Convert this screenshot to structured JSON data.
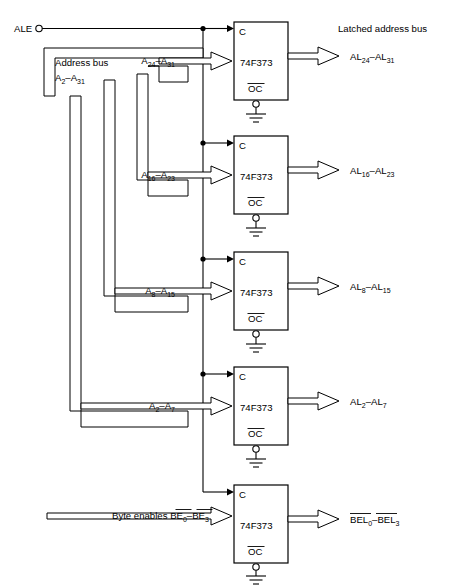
{
  "diagram": {
    "signals": {
      "ale_label": "ALE",
      "address_bus_line1": "Address bus",
      "address_bus_line2_base": "A",
      "address_bus_line2_sub_lo": "2",
      "address_bus_line2_dash": "–A",
      "address_bus_line2_sub_hi": "31",
      "latched_bus_header": "Latched address bus",
      "byte_enables_text": "Byte enables",
      "chip_type": "74F373",
      "clock_pin": "C",
      "oc_pin": "OC"
    },
    "latches": [
      {
        "id": "latch-1",
        "chip": "74F373",
        "clock_pin": "C",
        "oc_pin": "OC",
        "input_base": "A",
        "input_sub_lo": "24",
        "input_dash": "–A",
        "input_sub_hi": "31",
        "output_base": "AL",
        "output_sub_lo": "24",
        "output_dash": "–AL",
        "output_sub_hi": "31",
        "overline_input": false,
        "overline_output": false
      },
      {
        "id": "latch-2",
        "chip": "74F373",
        "clock_pin": "C",
        "oc_pin": "OC",
        "input_base": "A",
        "input_sub_lo": "16",
        "input_dash": "–A",
        "input_sub_hi": "23",
        "output_base": "AL",
        "output_sub_lo": "16",
        "output_dash": "–AL",
        "output_sub_hi": "23",
        "overline_input": false,
        "overline_output": false
      },
      {
        "id": "latch-3",
        "chip": "74F373",
        "clock_pin": "C",
        "oc_pin": "OC",
        "input_base": "A",
        "input_sub_lo": "8",
        "input_dash": "–A",
        "input_sub_hi": "15",
        "output_base": "AL",
        "output_sub_lo": "8",
        "output_dash": "–AL",
        "output_sub_hi": "15",
        "overline_input": false,
        "overline_output": false
      },
      {
        "id": "latch-4",
        "chip": "74F373",
        "clock_pin": "C",
        "oc_pin": "OC",
        "input_base": "A",
        "input_sub_lo": "2",
        "input_dash": "–A",
        "input_sub_hi": "7",
        "output_base": "AL",
        "output_sub_lo": "2",
        "output_dash": "–AL",
        "output_sub_hi": "7",
        "overline_input": false,
        "overline_output": false
      },
      {
        "id": "latch-5",
        "chip": "74F373",
        "clock_pin": "C",
        "oc_pin": "OC",
        "input_base": "BE",
        "input_sub_lo": "0",
        "input_dash": "–BE",
        "input_sub_hi": "3",
        "output_base": "BEL",
        "output_sub_lo": "0",
        "output_dash": "–BEL",
        "output_sub_hi": "3",
        "overline_input": true,
        "overline_output": true
      }
    ],
    "colors": {
      "ink": "#000000",
      "paper": "#ffffff"
    }
  }
}
